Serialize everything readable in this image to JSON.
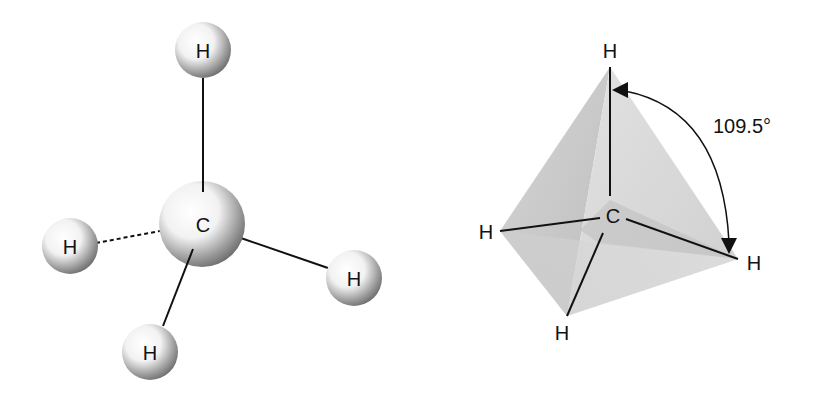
{
  "ball_and_stick": {
    "carbon_label": "C",
    "hydrogen_labels": [
      "H",
      "H",
      "H",
      "H"
    ]
  },
  "tetrahedron": {
    "carbon_label": "C",
    "hydrogen_labels": [
      "H",
      "H",
      "H",
      "H"
    ],
    "bond_angle": "109.5°"
  }
}
